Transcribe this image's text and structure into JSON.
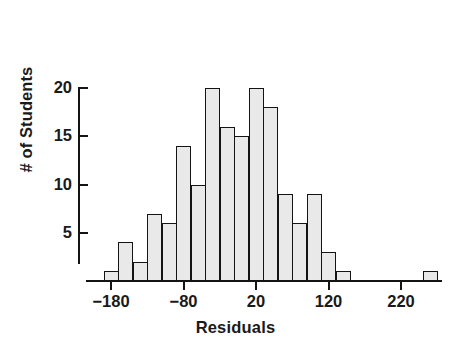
{
  "chart_data": {
    "type": "bar",
    "title": "",
    "xlabel": "Residuals",
    "ylabel": "# of Students",
    "xlim": [
      -200,
      300
    ],
    "ylim": [
      0,
      21
    ],
    "grid": false,
    "legend": null,
    "bin_width": 20,
    "xticks": [
      -180,
      -80,
      20,
      120,
      220
    ],
    "xtick_labels": [
      "−180",
      "−80",
      "20",
      "120",
      "220"
    ],
    "yticks": [
      5,
      10,
      15,
      20
    ],
    "ytick_labels": [
      "5",
      "10",
      "15",
      "20"
    ],
    "categories": [
      "-190 to -170",
      "-170 to -150",
      "-150 to -130",
      "-130 to -110",
      "-110 to -90",
      "-90 to -70",
      "-70 to -50",
      "-50 to -30",
      "-30 to -10",
      "-10 to 10",
      "10 to 30",
      "30 to 50",
      "50 to 70",
      "70 to 90",
      "90 to 110",
      "110 to 130",
      "130 to 150",
      "250 to 270"
    ],
    "bin_starts": [
      -190,
      -170,
      -150,
      -130,
      -110,
      -90,
      -70,
      -50,
      -30,
      -10,
      10,
      30,
      50,
      70,
      90,
      110,
      130,
      250
    ],
    "values": [
      1,
      4,
      2,
      7,
      6,
      14,
      10,
      20,
      16,
      15,
      20,
      18,
      9,
      6,
      9,
      3,
      1,
      1
    ],
    "colors": {
      "bar_fill": "#e9e9e9",
      "bar_stroke": "#141414",
      "axis": "#141414",
      "text": "#1a1a1a",
      "background": "#ffffff"
    }
  },
  "axis_titles": {
    "x": "Residuals",
    "y": "# of Students"
  }
}
